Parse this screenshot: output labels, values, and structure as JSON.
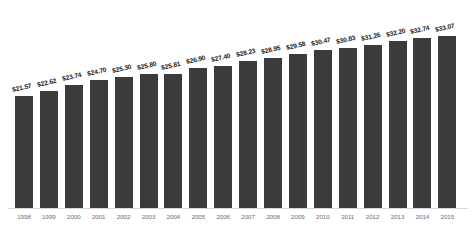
{
  "chart_data": {
    "type": "bar",
    "title": "",
    "subtitle": "",
    "xlabel": "",
    "ylabel": "",
    "grid": false,
    "legend": null,
    "ylim": [
      0,
      36
    ],
    "bar_color": "#3b3b3b",
    "label_color": "#1a1a1a",
    "tick_color": "#6d6d6d",
    "background": "#ffffff",
    "categories": [
      "1998",
      "1999",
      "2000",
      "2001",
      "2002",
      "2003",
      "2004",
      "2005",
      "2006",
      "2007",
      "2008",
      "2009",
      "2010",
      "2011",
      "2012",
      "2013",
      "2014",
      "2015"
    ],
    "values": [
      21.57,
      22.62,
      23.74,
      24.7,
      25.3,
      25.8,
      25.81,
      26.9,
      27.4,
      28.23,
      28.95,
      29.58,
      30.47,
      30.83,
      31.26,
      32.2,
      32.74,
      33.07
    ],
    "data_labels": [
      "$21.57",
      "$22.62",
      "$23.74",
      "$24.70",
      "$25.30",
      "$25.80",
      "$25.81",
      "$26.90",
      "$27.40",
      "$28.23",
      "$28.95",
      "$29.58",
      "$30.47",
      "$30.83",
      "$31.26",
      "$32.20",
      "$32.74",
      "$33.07"
    ]
  }
}
